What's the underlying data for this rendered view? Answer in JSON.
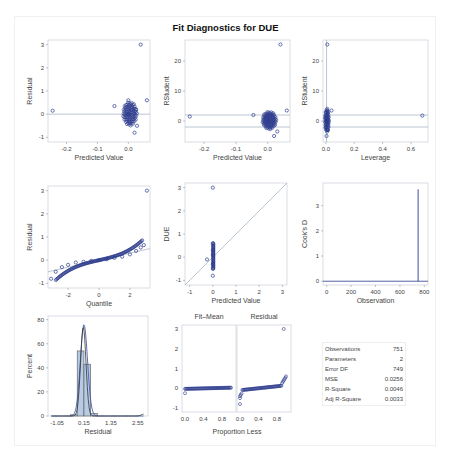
{
  "title": "Fit Diagnostics for DUE",
  "colors": {
    "marker": "#2b3a8c",
    "refline": "#a9b7c8",
    "frame": "#c9cfd8",
    "bar": "#b7cce4"
  },
  "chart_data": [
    {
      "type": "scatter",
      "title": "Residual vs Predicted",
      "xlabel": "Predicted Value",
      "ylabel": "Residual",
      "xticks": [
        "-0.2",
        "-0.1",
        "0.0"
      ],
      "yticks": [
        "-1",
        "0",
        "1",
        "2",
        "3"
      ],
      "xlim": [
        -0.26,
        0.07
      ],
      "ylim": [
        -1.2,
        3.2
      ],
      "reflines_y": [
        0
      ],
      "points": [
        [
          -0.245,
          0.15
        ],
        [
          0.04,
          3.0
        ],
        [
          0.06,
          0.6
        ],
        [
          -0.045,
          0.35
        ],
        [
          0.0,
          0.6
        ],
        [
          0.02,
          -0.8
        ],
        [
          0.028,
          -0.5
        ],
        [
          0.025,
          0.2
        ],
        [
          0.0,
          0.0
        ]
      ]
    },
    {
      "type": "scatter",
      "title": "RStudent vs Predicted",
      "xlabel": "Predicted Value",
      "ylabel": "RStudent",
      "xticks": [
        "-0.2",
        "-0.1",
        "0.0"
      ],
      "yticks": [
        "0",
        "10",
        "20"
      ],
      "xlim": [
        -0.26,
        0.07
      ],
      "ylim": [
        -7,
        27
      ],
      "reflines_y": [
        2,
        -2
      ],
      "points": [
        [
          -0.245,
          1.5
        ],
        [
          0.04,
          25.5
        ],
        [
          0.06,
          3.5
        ],
        [
          -0.045,
          2
        ],
        [
          0.02,
          -5
        ],
        [
          0.03,
          -3.5
        ],
        [
          0.0,
          0.0
        ]
      ]
    },
    {
      "type": "scatter",
      "title": "RStudent vs Leverage",
      "xlabel": "Leverage",
      "ylabel": "RStudent",
      "xticks": [
        "0.0",
        "0.2",
        "0.4",
        "0.6"
      ],
      "yticks": [
        "0",
        "10",
        "20"
      ],
      "xlim": [
        -0.02,
        0.72
      ],
      "ylim": [
        -7,
        27
      ],
      "reflines_y": [
        2,
        -2
      ],
      "reflines_x": [
        0.005
      ],
      "points": [
        [
          0.68,
          1.8
        ],
        [
          0.01,
          25.5
        ],
        [
          0.04,
          3.5
        ],
        [
          0.005,
          -5
        ],
        [
          0.01,
          -3
        ],
        [
          0.005,
          0.0
        ]
      ]
    },
    {
      "type": "scatter",
      "title": "Q-Q Plot of Residuals",
      "xlabel": "Quantile",
      "ylabel": "Residual",
      "xticks": [
        "-2",
        "0",
        "2"
      ],
      "yticks": [
        "-1",
        "0",
        "1",
        "2",
        "3"
      ],
      "xlim": [
        -3.3,
        3.3
      ],
      "ylim": [
        -1.2,
        3.2
      ],
      "points": [
        [
          -3.1,
          -0.8
        ],
        [
          -2.8,
          -0.5
        ],
        [
          -2.4,
          -0.3
        ],
        [
          -2,
          -0.2
        ],
        [
          -1.5,
          -0.1
        ],
        [
          -1,
          -0.07
        ],
        [
          -0.5,
          -0.03
        ],
        [
          0,
          0
        ],
        [
          0.5,
          0.04
        ],
        [
          1,
          0.1
        ],
        [
          1.5,
          0.15
        ],
        [
          2,
          0.25
        ],
        [
          2.4,
          0.4
        ],
        [
          2.7,
          0.55
        ],
        [
          2.9,
          0.65
        ],
        [
          3.1,
          3.0
        ]
      ]
    },
    {
      "type": "scatter",
      "title": "DUE vs Predicted",
      "xlabel": "Predicted Value",
      "ylabel": "DUE",
      "xticks": [
        "-1",
        "0",
        "1",
        "2",
        "3"
      ],
      "yticks": [
        "-1",
        "0",
        "1",
        "2",
        "3"
      ],
      "xlim": [
        -1.2,
        3.2
      ],
      "ylim": [
        -1.2,
        3.2
      ],
      "diagonal": true,
      "points": [
        [
          0,
          3.0
        ],
        [
          -0.25,
          -0.1
        ],
        [
          0,
          0.6
        ],
        [
          0,
          -0.8
        ],
        [
          0,
          0.3
        ],
        [
          0,
          -0.3
        ],
        [
          0,
          0.1
        ],
        [
          0,
          -0.5
        ]
      ]
    },
    {
      "type": "line",
      "title": "Cook's D",
      "xlabel": "Observation",
      "ylabel": "Cook's D",
      "xticks": [
        "0",
        "200",
        "400",
        "600",
        "800"
      ],
      "yticks": [
        "0",
        "1",
        "2",
        "3"
      ],
      "xlim": [
        -30,
        830
      ],
      "ylim": [
        -0.15,
        3.9
      ],
      "spike": {
        "x": 749,
        "y": 3.65
      }
    },
    {
      "type": "bar",
      "title": "Residual Histogram",
      "xlabel": "Residual",
      "ylabel": "Percent",
      "xticks": [
        "-1.05",
        "0.15",
        "1.35",
        "2.55"
      ],
      "yticks": [
        "0",
        "20",
        "40",
        "60",
        "80"
      ],
      "ylim": [
        0,
        83
      ],
      "bins": [
        {
          "from": -0.45,
          "to": -0.15,
          "value": 1
        },
        {
          "from": -0.15,
          "to": 0.15,
          "value": 54
        },
        {
          "from": 0.15,
          "to": 0.45,
          "value": 43
        },
        {
          "from": 0.45,
          "to": 0.75,
          "value": 2
        }
      ],
      "curves": [
        "normal",
        "kernel"
      ]
    },
    {
      "type": "scatter",
      "title": "Residual-Fit Spread",
      "panels": [
        "Fit–Mean",
        "Residual"
      ],
      "xlabel": "Proportion Less",
      "xticks": [
        "0.0",
        "0.4",
        "0.8"
      ],
      "yticks": [
        "-1",
        "0",
        "1",
        "2",
        "3"
      ],
      "ylim": [
        -1.2,
        3.2
      ]
    }
  ],
  "stats": [
    {
      "label": "Observations",
      "value": "751"
    },
    {
      "label": "Parameters",
      "value": "2"
    },
    {
      "label": "Error DF",
      "value": "749"
    },
    {
      "label": "MSE",
      "value": "0.0256"
    },
    {
      "label": "R-Square",
      "value": "0.0046"
    },
    {
      "label": "Adj R-Square",
      "value": "0.0033"
    }
  ]
}
